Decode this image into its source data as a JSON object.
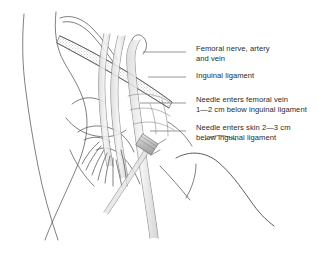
{
  "figure": {
    "background_color": "#ffffff",
    "line_color": "#555555",
    "text_color": "#2b2b2b"
  },
  "labels": [
    {
      "id": "femoral-nerve-artery-vein",
      "lines": [
        "Femoral nerve, artery",
        "and vein"
      ],
      "x": 196,
      "y": 45,
      "leader": {
        "x1": 186,
        "y1": 52,
        "x2": 143,
        "y2": 52
      }
    },
    {
      "id": "inguinal-ligament",
      "lines": [
        "Inguinal ligament"
      ],
      "x": 196,
      "y": 72,
      "leader": {
        "x1": 186,
        "y1": 77,
        "x2": 148,
        "y2": 77
      }
    },
    {
      "id": "needle-enters-femoral-vein",
      "lines": [
        "Needle enters femoral vein",
        "1—2 cm below inguinal ligament"
      ],
      "x": 196,
      "y": 96,
      "leader": {
        "x1": 186,
        "y1": 103,
        "x2": 140,
        "y2": 103
      }
    },
    {
      "id": "needle-enters-skin",
      "lines": [
        "Needle enters skin 2—3 cm",
        "below inguinal ligament"
      ],
      "x": 196,
      "y": 124,
      "leader": {
        "x1": 186,
        "y1": 131,
        "x2": 150,
        "y2": 131
      }
    }
  ],
  "anatomy": {
    "parts": [
      {
        "name": "abdominal-wall-outline"
      },
      {
        "name": "iliac-crest-outline"
      },
      {
        "name": "pelvic-bone-outline"
      },
      {
        "name": "inguinal-ligament-band"
      },
      {
        "name": "femoral-nerve"
      },
      {
        "name": "femoral-artery"
      },
      {
        "name": "femoral-vein"
      },
      {
        "name": "saphenous-vein"
      },
      {
        "name": "needle-syringe"
      },
      {
        "name": "thigh-outline"
      },
      {
        "name": "buttock-contour"
      }
    ]
  }
}
